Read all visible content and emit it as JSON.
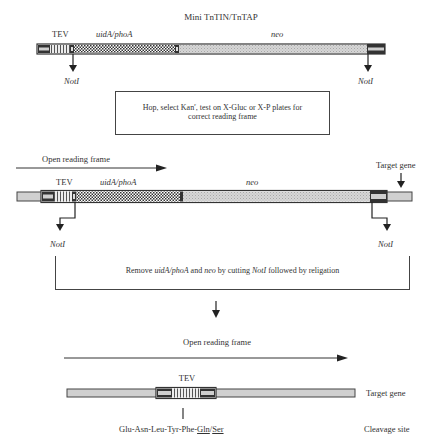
{
  "title": "Mini TnTIN/TnTAP",
  "construct1": {
    "labels": {
      "tev": "TEV",
      "reporter": "uidA/phoA",
      "marker": "neo"
    },
    "sites": {
      "left": "NotI",
      "right": "NotI"
    }
  },
  "step1": {
    "line1_pre": "Hop, select Kan",
    "line1_sup": "r",
    "line1_post": ", test on X-Gluc or X-P plates for",
    "line2": "correct reading frame"
  },
  "construct2": {
    "orf_label": "Open reading frame",
    "target_label": "Target gene",
    "labels": {
      "tev": "TEV",
      "reporter": "uidA/phoA",
      "marker": "neo"
    },
    "sites": {
      "left": "NotI",
      "right": "NotI"
    }
  },
  "step2": {
    "pre": "Remove ",
    "reporter": "uidA/phoA",
    "mid1": " and ",
    "marker": "neo",
    "mid2": " by cutting ",
    "enzyme": "NotI",
    "post": " followed by religation"
  },
  "final": {
    "orf_label": "Open reading frame",
    "tev": "TEV",
    "target_label": "Target gene",
    "sequence_prefix": "Glu-Asn-Leu-Tyr-Phe-",
    "sequence_p1": "Gln",
    "sequence_sep": "/",
    "sequence_p1prime": "Ser",
    "cleavage_label": "Cleavage site"
  },
  "colors": {
    "outline": "#333333",
    "neo_fill": "#d4d4d4",
    "end_fill": "#c8c8c8",
    "checker_dark": "#333333",
    "checker_light": "#ffffff"
  }
}
